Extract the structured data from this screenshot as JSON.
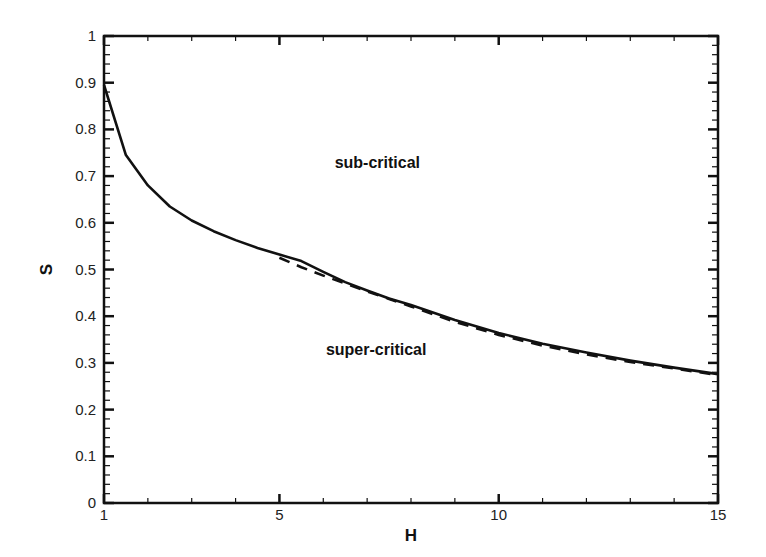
{
  "chart_data": {
    "type": "line",
    "title": "",
    "xlabel": "H",
    "ylabel": "S",
    "xlim": [
      1,
      15
    ],
    "ylim": [
      0,
      1
    ],
    "x_major_ticks": [
      1,
      5,
      10,
      15
    ],
    "x_minor_step": 1,
    "y_major_ticks": [
      0,
      0.1,
      0.2,
      0.3,
      0.4,
      0.5,
      0.6,
      0.7,
      0.8,
      0.9,
      1
    ],
    "y_tick_labels": [
      "0",
      "0.1",
      "0.2",
      "0.3",
      "0.4",
      "0.5",
      "0.6",
      "0.7",
      "0.8",
      "0.9",
      "1"
    ],
    "y_minor_step": 0.02,
    "grid": false,
    "legend": null,
    "series": [
      {
        "name": "solid boundary",
        "style": "solid",
        "color": "#111111",
        "x": [
          1.0,
          1.5,
          2.0,
          2.5,
          3.0,
          3.5,
          4.0,
          4.5,
          5.0,
          5.5,
          6.0,
          6.5,
          7.0,
          7.5,
          8.0,
          9.0,
          10.0,
          11.0,
          12.0,
          13.0,
          14.0,
          15.0
        ],
        "y": [
          0.895,
          0.745,
          0.68,
          0.635,
          0.605,
          0.582,
          0.563,
          0.546,
          0.532,
          0.518,
          0.495,
          0.473,
          0.455,
          0.438,
          0.424,
          0.392,
          0.364,
          0.341,
          0.322,
          0.305,
          0.29,
          0.276
        ]
      },
      {
        "name": "dashed boundary",
        "style": "dashed",
        "color": "#111111",
        "x": [
          5.0,
          5.5,
          6.0,
          6.5,
          7.0,
          7.5,
          8.0,
          9.0,
          10.0,
          11.0,
          12.0,
          13.0,
          14.0,
          15.0
        ],
        "y": [
          0.525,
          0.505,
          0.487,
          0.47,
          0.453,
          0.437,
          0.421,
          0.388,
          0.36,
          0.337,
          0.318,
          0.302,
          0.288,
          0.274
        ]
      }
    ],
    "annotations": [
      {
        "text": "sub-critical",
        "x": 7.4,
        "y": 0.73
      },
      {
        "text": "super-critical",
        "x": 7.2,
        "y": 0.33
      }
    ]
  }
}
